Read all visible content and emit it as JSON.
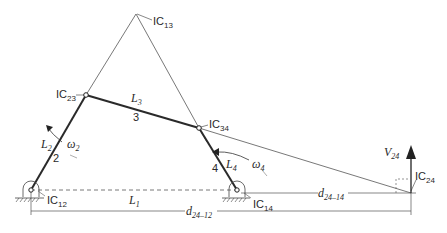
{
  "diagram": {
    "type": "four-bar linkage instant centers",
    "labels": {
      "ic13": {
        "base": "IC",
        "sub": "13"
      },
      "ic23": {
        "base": "IC",
        "sub": "23"
      },
      "ic34": {
        "base": "IC",
        "sub": "34"
      },
      "ic12": {
        "base": "IC",
        "sub": "12"
      },
      "ic14": {
        "base": "IC",
        "sub": "14"
      },
      "ic24": {
        "base": "IC",
        "sub": "24"
      },
      "L1": {
        "base": "L",
        "sub": "1"
      },
      "L2": {
        "base": "L",
        "sub": "2"
      },
      "L3": {
        "base": "L",
        "sub": "3"
      },
      "L4": {
        "base": "L",
        "sub": "4"
      },
      "link2": "2",
      "link3": "3",
      "link4": "4",
      "omega2": {
        "base": "ω",
        "sub": "2"
      },
      "omega4": {
        "base": "ω",
        "sub": "4"
      },
      "v24": {
        "base": "V",
        "sub": "24"
      },
      "d2414": {
        "base": "d",
        "sub": "24–14"
      },
      "d2412": {
        "base": "d",
        "sub": "24–12"
      }
    }
  }
}
